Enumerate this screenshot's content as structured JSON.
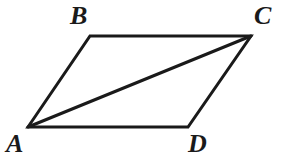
{
  "figure": {
    "type": "geometry-diagram",
    "shape": "parallelogram-with-diagonal",
    "background_color": "#ffffff",
    "stroke_color": "#1a1a1a",
    "stroke_width": 3,
    "canvas": {
      "width": 294,
      "height": 165
    },
    "vertices": [
      {
        "id": "A",
        "label": "A",
        "x": 28,
        "y": 127,
        "label_x": 6,
        "label_y": 131
      },
      {
        "id": "B",
        "label": "B",
        "x": 90,
        "y": 36,
        "label_x": 70,
        "label_y": 3
      },
      {
        "id": "C",
        "label": "C",
        "x": 251,
        "y": 36,
        "label_x": 254,
        "label_y": 3
      },
      {
        "id": "D",
        "label": "D",
        "x": 188,
        "y": 127,
        "label_x": 188,
        "label_y": 131
      }
    ],
    "edges": [
      {
        "id": "AB",
        "from": "A",
        "to": "B",
        "kind": "side"
      },
      {
        "id": "BC",
        "from": "B",
        "to": "C",
        "kind": "side"
      },
      {
        "id": "CD",
        "from": "C",
        "to": "D",
        "kind": "side"
      },
      {
        "id": "DA",
        "from": "D",
        "to": "A",
        "kind": "side"
      },
      {
        "id": "AC",
        "from": "A",
        "to": "C",
        "kind": "diagonal"
      }
    ],
    "outline_path": "M 28 127 L 90 36 L 251 36 L 188 127 Z",
    "diagonal_path": "M 28 127 L 251 36"
  }
}
